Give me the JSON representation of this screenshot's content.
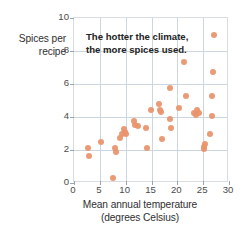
{
  "chart_data": {
    "type": "scatter",
    "title": "",
    "annotation": {
      "line1": "The hotter the climate,",
      "line2": "the more spices used."
    },
    "xlabel_line1": "Mean annual temperature",
    "xlabel_line2": "(degrees Celsius)",
    "ylabel_line1": "Spices per",
    "ylabel_line2": "recipe",
    "xlim": [
      0,
      30
    ],
    "ylim": [
      0,
      10
    ],
    "xticks": [
      0,
      5,
      10,
      15,
      20,
      25,
      30
    ],
    "yticks": [
      0,
      2,
      4,
      6,
      8,
      10
    ],
    "grid": true,
    "legend": "none",
    "point_color": "#e8936a",
    "grid_color": "#ccd6e0",
    "frame_color": "#d8dde2",
    "points": [
      [
        2.8,
        2.15
      ],
      [
        2.9,
        1.65
      ],
      [
        5.2,
        2.5
      ],
      [
        7.6,
        0.3
      ],
      [
        8.0,
        2.15
      ],
      [
        8.1,
        1.9
      ],
      [
        8.9,
        2.75
      ],
      [
        9.3,
        3.0
      ],
      [
        9.6,
        3.25
      ],
      [
        9.8,
        3.1
      ],
      [
        10.1,
        2.95
      ],
      [
        11.6,
        3.75
      ],
      [
        11.9,
        3.5
      ],
      [
        12.3,
        3.45
      ],
      [
        13.9,
        3.35
      ],
      [
        14.1,
        2.1
      ],
      [
        14.9,
        4.4
      ],
      [
        16.4,
        4.8
      ],
      [
        16.6,
        4.4
      ],
      [
        16.8,
        4.3
      ],
      [
        17.0,
        2.65
      ],
      [
        18.5,
        5.75
      ],
      [
        18.6,
        3.85
      ],
      [
        18.7,
        3.35
      ],
      [
        20.3,
        4.55
      ],
      [
        21.3,
        7.35
      ],
      [
        21.6,
        5.3
      ],
      [
        23.2,
        4.25
      ],
      [
        23.6,
        4.15
      ],
      [
        23.9,
        4.45
      ],
      [
        24.1,
        4.25
      ],
      [
        25.1,
        2.2
      ],
      [
        25.2,
        2.05
      ],
      [
        25.3,
        2.35
      ],
      [
        26.3,
        3.0
      ],
      [
        26.7,
        5.25
      ],
      [
        26.8,
        4.05
      ],
      [
        26.9,
        6.75
      ],
      [
        27.0,
        9.0
      ]
    ]
  }
}
